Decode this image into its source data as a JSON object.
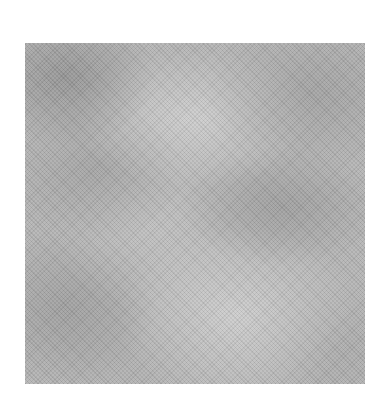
{
  "image": {
    "description": "Gray cloudy mottled texture swatch with fine diagonal crosshatch weave",
    "colors": {
      "background": "#ffffff",
      "base_gray": "#b4b4b4",
      "dark_gray": "#8c8c8c",
      "light_gray": "#d7d7d7"
    }
  }
}
